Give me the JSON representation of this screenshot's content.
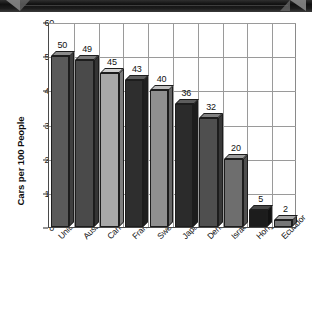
{
  "banner": {
    "name": "decorative-top-banner"
  },
  "chart_data": {
    "type": "bar",
    "title": "",
    "xlabel": "",
    "ylabel": "Cars per 100 People",
    "ylim": [
      0,
      60
    ],
    "ytick_labels": [
      "0",
      "10",
      "20",
      "30",
      "40",
      "50",
      "60"
    ],
    "ytick_values": [
      0,
      10,
      20,
      30,
      40,
      50,
      60
    ],
    "grid": true,
    "legend": false,
    "categories": [
      "United States",
      "Australia",
      "Canada",
      "France",
      "Sweden",
      "Japan",
      "Denmark",
      "Israel",
      "Hong Kong",
      "Ecuador"
    ],
    "values": [
      50,
      49,
      45,
      43,
      40,
      36,
      32,
      20,
      5,
      2
    ],
    "value_labels": [
      "50",
      "49",
      "45",
      "43",
      "40",
      "36",
      "32",
      "20",
      "5",
      "2"
    ],
    "bar_colors": [
      "#5a5a5a",
      "#4a4a4a",
      "#a8a8a8",
      "#2e2e2e",
      "#909090",
      "#2b2b2b",
      "#4f4f4f",
      "#6e6e6e",
      "#1c1c1c",
      "#767676"
    ],
    "bar_top_colors": [
      "#8c8c8c",
      "#7c7c7c",
      "#cfcfcf",
      "#606060",
      "#bdbdbd",
      "#5d5d5d",
      "#828282",
      "#9d9d9d",
      "#484848",
      "#a6a6a6"
    ],
    "bar_side_colors": [
      "#3f3f3f",
      "#343434",
      "#7e7e7e",
      "#1f1f1f",
      "#666666",
      "#1d1d1d",
      "#383838",
      "#4f4f4f",
      "#121212",
      "#555555"
    ]
  }
}
